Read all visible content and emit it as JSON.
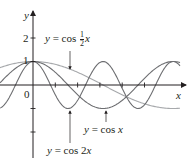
{
  "chart_data": {
    "type": "line",
    "title": "",
    "xlabel": "x",
    "ylabel": "y",
    "xlim": [
      -1.5,
      6.9
    ],
    "ylim": [
      -3.2,
      3.3
    ],
    "grid": false,
    "legend": "inline annotations with arrows",
    "y_ticks": [
      {
        "value": 2,
        "label": "2"
      },
      {
        "value": 1,
        "label": "1"
      },
      {
        "value": -1,
        "label": ""
      },
      {
        "value": -2,
        "label": ""
      }
    ],
    "x_ticks": [
      1,
      2,
      3,
      4,
      5
    ],
    "origin_label": "0",
    "series": [
      {
        "name": "y = cos 2x",
        "expr": "cos(2*x)",
        "color": "#6d6e71",
        "label": {
          "prefix": "y = cos 2",
          "var": "x"
        }
      },
      {
        "name": "y = cos x",
        "expr": "cos(x)",
        "color": "#6d6e71",
        "label": {
          "prefix": "y = cos ",
          "var": "x"
        }
      },
      {
        "name": "y = cos (1/2)x",
        "expr": "cos(x/2)",
        "color": "#a7a9ac",
        "label": {
          "prefix": "y = cos",
          "num": "1",
          "den": "2",
          "var": "x"
        }
      }
    ]
  },
  "axes": {
    "x_label": "x",
    "y_label": "y",
    "tick_1": "1",
    "tick_2": "2",
    "origin": "0"
  },
  "labels": {
    "cos_half_x": {
      "y": "y",
      "eq": " = cos",
      "num": "1",
      "den": "2",
      "x": "x"
    },
    "cos_x": {
      "y": "y",
      "eq": " = cos ",
      "x": "x"
    },
    "cos_2x": {
      "y": "y",
      "eq": " = cos 2",
      "x": "x"
    }
  },
  "colors": {
    "axis": "#231f20",
    "curve_dark": "#6d6e71",
    "curve_light": "#a7a9ac"
  }
}
